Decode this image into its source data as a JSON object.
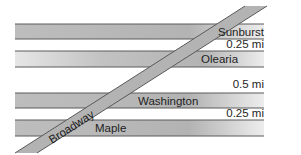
{
  "map": {
    "colors": {
      "road_fill_dark": "#b5b5b5",
      "road_fill_light": "#ececec",
      "road_edge": "#5a5a5a",
      "label": "#1e1e1e",
      "background": "#ffffff"
    },
    "streets": [
      {
        "name": "Sunburst",
        "orientation": "horizontal"
      },
      {
        "name": "Olearia",
        "orientation": "horizontal"
      },
      {
        "name": "Washington",
        "orientation": "horizontal"
      },
      {
        "name": "Maple",
        "orientation": "horizontal"
      },
      {
        "name": "Broadway",
        "orientation": "diagonal"
      }
    ],
    "distances": [
      {
        "between": [
          "Sunburst",
          "Olearia"
        ],
        "label": "0.25 mi"
      },
      {
        "between": [
          "Olearia",
          "Washington"
        ],
        "label": "0.5 mi"
      },
      {
        "between": [
          "Washington",
          "Maple"
        ],
        "label": "0.25 mi"
      }
    ]
  }
}
